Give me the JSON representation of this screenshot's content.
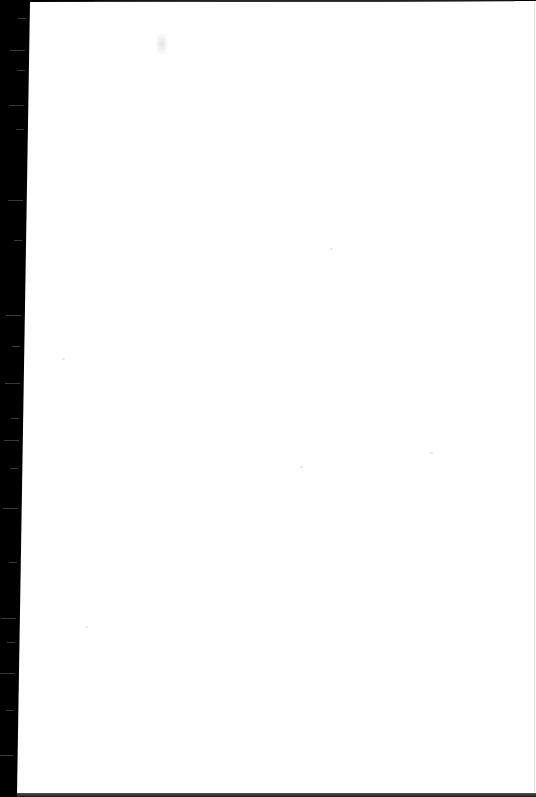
{
  "document": {
    "type": "scanned-page",
    "content_text": "",
    "state": "blank"
  },
  "colors": {
    "background_band": "#000000",
    "page": "#ffffff",
    "edge_shadow": "#333333"
  },
  "artifacts": {
    "smudge": {
      "x": 156,
      "y": 33,
      "legible": false
    },
    "streaks_y": [
      18,
      50,
      70,
      105,
      129,
      200,
      240,
      315,
      346,
      383,
      418,
      440,
      468,
      508,
      562,
      618,
      642,
      673,
      710,
      755
    ]
  }
}
